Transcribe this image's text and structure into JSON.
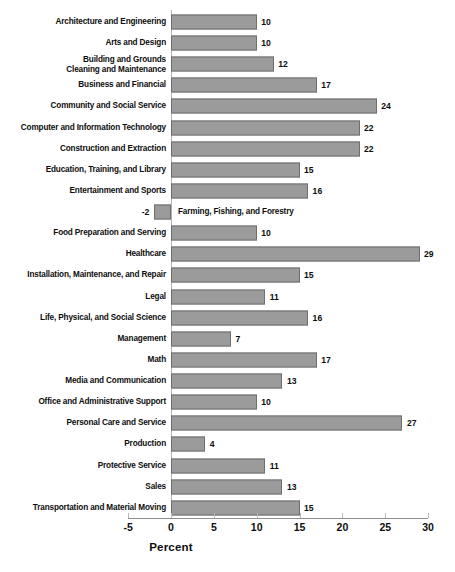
{
  "chart_data": {
    "type": "bar",
    "orientation": "horizontal",
    "title": "",
    "xlabel": "Percent",
    "ylabel": "",
    "xlim": [
      -5,
      30
    ],
    "xticks": [
      -5,
      0,
      5,
      10,
      15,
      20,
      25,
      30
    ],
    "xtick_labels": [
      "-5",
      "0",
      "5",
      "10",
      "15",
      "20",
      "25",
      "30"
    ],
    "grid": false,
    "legend": null,
    "bar_color": "#9b9b9b",
    "bar_border_color": "#6e6e6e",
    "categories": [
      "Architecture and Engineering",
      "Arts and Design",
      "Building and Grounds\nCleaning and Maintenance",
      "Business and Financial",
      "Community and Social Service",
      "Computer and Information Technology",
      "Construction and Extraction",
      "Education, Training, and Library",
      "Entertainment and Sports",
      "Farming, Fishing, and Forestry",
      "Food Preparation and Serving",
      "Healthcare",
      "Installation, Maintenance, and Repair",
      "Legal",
      "Life, Physical, and Social Science",
      "Management",
      "Math",
      "Media and Communication",
      "Office and Administrative Support",
      "Personal Care and Service",
      "Production",
      "Protective Service",
      "Sales",
      "Transportation and Material Moving"
    ],
    "values": [
      10,
      10,
      12,
      17,
      24,
      22,
      22,
      15,
      16,
      -2,
      10,
      29,
      15,
      11,
      16,
      7,
      17,
      13,
      10,
      27,
      4,
      11,
      13,
      15
    ],
    "value_labels": [
      "10",
      "10",
      "12",
      "17",
      "24",
      "22",
      "22",
      "15",
      "16",
      "-2",
      "10",
      "29",
      "15",
      "11",
      "16",
      "7",
      "17",
      "13",
      "10",
      "27",
      "4",
      "11",
      "13",
      "15"
    ]
  }
}
